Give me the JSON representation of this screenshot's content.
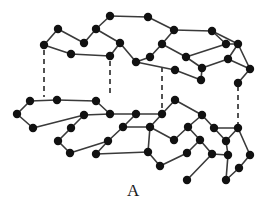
{
  "figure": {
    "label": "A",
    "title": "A",
    "colors": {
      "background": "#ffffff",
      "atom": "#111111",
      "bond": "#3a3a3a",
      "interlayer_bond": "#1a1a1a",
      "label": "#1a1a1a"
    },
    "style": {
      "atom_radius": 4.2,
      "bond_width": 1.6,
      "interlayer_dash": "5,4",
      "interlayer_width": 1.5
    }
  },
  "chart_data": {
    "type": "scatter",
    "title": "A",
    "xlabel": "",
    "ylabel": "",
    "xlim": [
      0,
      267
    ],
    "ylim": [
      0,
      215
    ],
    "grid": false,
    "legend": null,
    "atom_count": 56,
    "bond_count": 68,
    "interlayer_bond_count": 4,
    "atoms": [
      {
        "id": "t1",
        "x": 44,
        "y": 45
      },
      {
        "id": "t2",
        "x": 58,
        "y": 29
      },
      {
        "id": "t3",
        "x": 71,
        "y": 54
      },
      {
        "id": "t4",
        "x": 96,
        "y": 29
      },
      {
        "id": "t5",
        "x": 110,
        "y": 56
      },
      {
        "id": "t6",
        "x": 110,
        "y": 16
      },
      {
        "id": "t7",
        "x": 136,
        "y": 62
      },
      {
        "id": "t8",
        "x": 148,
        "y": 17
      },
      {
        "id": "t9",
        "x": 162,
        "y": 44
      },
      {
        "id": "t10",
        "x": 174,
        "y": 30
      },
      {
        "id": "t11",
        "x": 175,
        "y": 70
      },
      {
        "id": "t12",
        "x": 186,
        "y": 57
      },
      {
        "id": "t13",
        "x": 201,
        "y": 80
      },
      {
        "id": "t14",
        "x": 212,
        "y": 31
      },
      {
        "id": "t15",
        "x": 226,
        "y": 44
      },
      {
        "id": "t16",
        "x": 228,
        "y": 59
      },
      {
        "id": "t17",
        "x": 238,
        "y": 44
      },
      {
        "id": "t18",
        "x": 250,
        "y": 69
      },
      {
        "id": "t19",
        "x": 238,
        "y": 83
      },
      {
        "id": "t20",
        "x": 120,
        "y": 43
      },
      {
        "id": "t21",
        "x": 84,
        "y": 43
      },
      {
        "id": "t22",
        "x": 150,
        "y": 57
      },
      {
        "id": "t23",
        "x": 202,
        "y": 68
      },
      {
        "id": "b1",
        "x": 17,
        "y": 114
      },
      {
        "id": "b2",
        "x": 30,
        "y": 101
      },
      {
        "id": "b3",
        "x": 33,
        "y": 128
      },
      {
        "id": "b4",
        "x": 57,
        "y": 100
      },
      {
        "id": "b5",
        "x": 58,
        "y": 141
      },
      {
        "id": "b6",
        "x": 71,
        "y": 128
      },
      {
        "id": "b7",
        "x": 84,
        "y": 115
      },
      {
        "id": "b8",
        "x": 96,
        "y": 101
      },
      {
        "id": "b9",
        "x": 96,
        "y": 154
      },
      {
        "id": "b10",
        "x": 108,
        "y": 141
      },
      {
        "id": "b11",
        "x": 110,
        "y": 114
      },
      {
        "id": "b12",
        "x": 123,
        "y": 127
      },
      {
        "id": "b13",
        "x": 136,
        "y": 114
      },
      {
        "id": "b14",
        "x": 148,
        "y": 152
      },
      {
        "id": "b15",
        "x": 150,
        "y": 127
      },
      {
        "id": "b16",
        "x": 160,
        "y": 166
      },
      {
        "id": "b17",
        "x": 162,
        "y": 114
      },
      {
        "id": "b18",
        "x": 174,
        "y": 140
      },
      {
        "id": "b19",
        "x": 175,
        "y": 100
      },
      {
        "id": "b20",
        "x": 187,
        "y": 153
      },
      {
        "id": "b21",
        "x": 188,
        "y": 127
      },
      {
        "id": "b22",
        "x": 200,
        "y": 140
      },
      {
        "id": "b23",
        "x": 202,
        "y": 115
      },
      {
        "id": "b24",
        "x": 212,
        "y": 154
      },
      {
        "id": "b25",
        "x": 214,
        "y": 128
      },
      {
        "id": "b26",
        "x": 226,
        "y": 141
      },
      {
        "id": "b27",
        "x": 228,
        "y": 155
      },
      {
        "id": "b28",
        "x": 238,
        "y": 128
      },
      {
        "id": "b29",
        "x": 239,
        "y": 168
      },
      {
        "id": "b30",
        "x": 226,
        "y": 180
      },
      {
        "id": "b31",
        "x": 187,
        "y": 180
      },
      {
        "id": "b32",
        "x": 250,
        "y": 155
      },
      {
        "id": "b33",
        "x": 70,
        "y": 153
      }
    ],
    "bonds": [
      [
        "t1",
        "t2"
      ],
      [
        "t2",
        "t21"
      ],
      [
        "t21",
        "t4"
      ],
      [
        "t4",
        "t6"
      ],
      [
        "t6",
        "t8"
      ],
      [
        "t8",
        "t10"
      ],
      [
        "t10",
        "t14"
      ],
      [
        "t14",
        "t17"
      ],
      [
        "t1",
        "t3"
      ],
      [
        "t3",
        "t5"
      ],
      [
        "t5",
        "t20"
      ],
      [
        "t20",
        "t4"
      ],
      [
        "t20",
        "t7"
      ],
      [
        "t7",
        "t22"
      ],
      [
        "t22",
        "t9"
      ],
      [
        "t9",
        "t10"
      ],
      [
        "t9",
        "t12"
      ],
      [
        "t12",
        "t15"
      ],
      [
        "t15",
        "t14"
      ],
      [
        "t12",
        "t23"
      ],
      [
        "t23",
        "t16"
      ],
      [
        "t16",
        "t17"
      ],
      [
        "t11",
        "t7"
      ],
      [
        "t11",
        "t13"
      ],
      [
        "t13",
        "t23"
      ],
      [
        "t16",
        "t18"
      ],
      [
        "t18",
        "t19"
      ],
      [
        "t17",
        "t18"
      ],
      [
        "t15",
        "t17"
      ],
      [
        "b1",
        "b2"
      ],
      [
        "b2",
        "b4"
      ],
      [
        "b4",
        "b8"
      ],
      [
        "b8",
        "b11"
      ],
      [
        "b11",
        "b13"
      ],
      [
        "b13",
        "b17"
      ],
      [
        "b17",
        "b19"
      ],
      [
        "b19",
        "b23"
      ],
      [
        "b23",
        "b25"
      ],
      [
        "b25",
        "b28"
      ],
      [
        "b1",
        "b3"
      ],
      [
        "b3",
        "b7"
      ],
      [
        "b7",
        "b11"
      ],
      [
        "b7",
        "b6"
      ],
      [
        "b6",
        "b5"
      ],
      [
        "b5",
        "b33"
      ],
      [
        "b33",
        "b10"
      ],
      [
        "b10",
        "b12"
      ],
      [
        "b12",
        "b13"
      ],
      [
        "b12",
        "b15"
      ],
      [
        "b15",
        "b17"
      ],
      [
        "b15",
        "b14"
      ],
      [
        "b14",
        "b9"
      ],
      [
        "b9",
        "b10"
      ],
      [
        "b14",
        "b16"
      ],
      [
        "b16",
        "b20"
      ],
      [
        "b20",
        "b22"
      ],
      [
        "b22",
        "b21"
      ],
      [
        "b21",
        "b18"
      ],
      [
        "b18",
        "b15"
      ],
      [
        "b21",
        "b23"
      ],
      [
        "b22",
        "b24"
      ],
      [
        "b24",
        "b27"
      ],
      [
        "b27",
        "b26"
      ],
      [
        "b26",
        "b25"
      ],
      [
        "b26",
        "b28"
      ],
      [
        "b28",
        "b32"
      ],
      [
        "b32",
        "b29"
      ],
      [
        "b29",
        "b30"
      ],
      [
        "b30",
        "b27"
      ],
      [
        "b24",
        "b31"
      ]
    ],
    "interlayer_bonds": [
      {
        "from": "t1",
        "to": "b2",
        "x": 44,
        "y1": 50,
        "y2": 97,
        "style": "dashed"
      },
      {
        "from": "t5",
        "to": "b8",
        "x": 110,
        "y1": 61,
        "y2": 97,
        "style": "dashed"
      },
      {
        "from": "t7",
        "to": "b17",
        "x": 162,
        "y1": 67,
        "y2": 110,
        "style": "dashed"
      },
      {
        "from": "t13",
        "to": "b28",
        "x": 238,
        "y1": 86,
        "y2": 124,
        "style": "dashed"
      }
    ]
  }
}
